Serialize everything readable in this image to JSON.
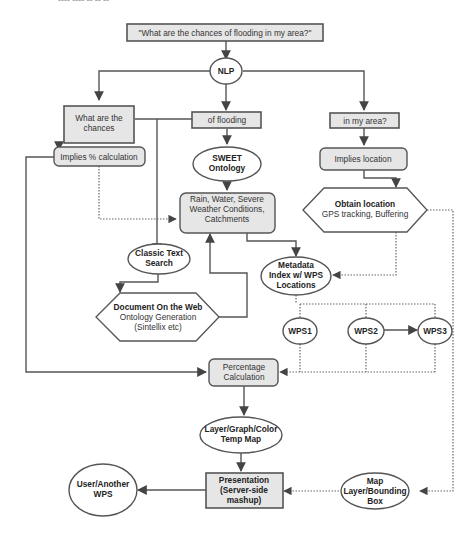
{
  "header_fragment": "---- ---- -- -- --",
  "nodes": {
    "query": "\"What are the chances of flooding in my area?\"",
    "nlp": "NLP",
    "what_chances": [
      "What are the",
      "chances"
    ],
    "of_flooding": "of flooding",
    "in_my_area": "in my area?",
    "implies_pct": "Implies % calculation",
    "sweet": [
      "SWEET",
      "Ontology"
    ],
    "implies_location": "Implies location",
    "rain": [
      "Rain, Water, Severe",
      "Weather Conditions,",
      "Catchments"
    ],
    "obtain_location": {
      "title": "Obtain location",
      "sub": "GPS tracking, Buffering"
    },
    "classic_search": [
      "Classic Text",
      "Search"
    ],
    "metadata_index": [
      "Metadata",
      "Index w/ WPS",
      "Locations"
    ],
    "doc_web": {
      "title": "Document On the Web",
      "sub1": "Ontology Generation",
      "sub2": "(Sintellix etc)"
    },
    "wps1": "WPS1",
    "wps2": "WPS2",
    "wps3": "WPS3",
    "pct_calc": [
      "Percentage",
      "Calculation"
    ],
    "layer_graph": [
      "Layer/Graph/Color",
      "Temp Map"
    ],
    "user_wps": [
      "User/Another",
      "WPS"
    ],
    "presentation": [
      "Presentation",
      "(Server-side",
      "mashup)"
    ],
    "map_layer": [
      "Map",
      "Layer/Bounding",
      "Box"
    ]
  },
  "colors": {
    "box_fill": "#e6e6e6",
    "stroke": "#555555",
    "background": "#ffffff"
  }
}
